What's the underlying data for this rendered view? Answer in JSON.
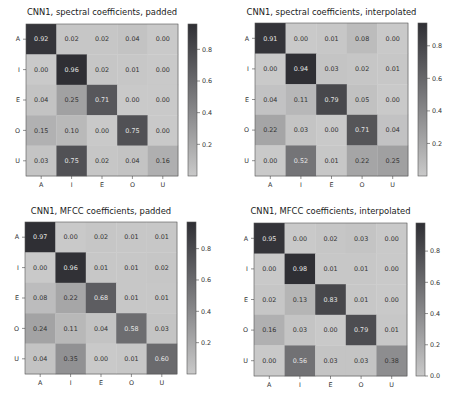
{
  "chart_data": [
    {
      "type": "heatmap",
      "title": "CNN1, spectral coefficients, padded",
      "row_labels": [
        "A",
        "I",
        "E",
        "O",
        "U"
      ],
      "col_labels": [
        "A",
        "I",
        "E",
        "O",
        "U"
      ],
      "values": [
        [
          0.92,
          0.02,
          0.02,
          0.04,
          0.0
        ],
        [
          0.0,
          0.96,
          0.02,
          0.01,
          0.0
        ],
        [
          0.04,
          0.25,
          0.71,
          0.0,
          0.0
        ],
        [
          0.15,
          0.1,
          0.0,
          0.75,
          0.0
        ],
        [
          0.03,
          0.75,
          0.02,
          0.04,
          0.16
        ]
      ],
      "colorbar": {
        "ticks": [
          "0.2",
          "0.4",
          "0.6",
          "0.8"
        ],
        "tick_values": [
          0.2,
          0.4,
          0.6,
          0.8
        ],
        "range": [
          0.0,
          0.96
        ]
      }
    },
    {
      "type": "heatmap",
      "title": "CNN1, spectral coefficients, interpolated",
      "row_labels": [
        "A",
        "I",
        "E",
        "O",
        "U"
      ],
      "col_labels": [
        "A",
        "I",
        "E",
        "O",
        "U"
      ],
      "values": [
        [
          0.91,
          0.0,
          0.01,
          0.08,
          0.0
        ],
        [
          0.0,
          0.94,
          0.03,
          0.02,
          0.01
        ],
        [
          0.04,
          0.11,
          0.79,
          0.05,
          0.0
        ],
        [
          0.22,
          0.03,
          0.0,
          0.71,
          0.04
        ],
        [
          0.0,
          0.52,
          0.01,
          0.22,
          0.25
        ]
      ],
      "colorbar": {
        "ticks": [
          "0.2",
          "0.4",
          "0.6",
          "0.8"
        ],
        "tick_values": [
          0.2,
          0.4,
          0.6,
          0.8
        ],
        "range": [
          0.0,
          0.94
        ]
      }
    },
    {
      "type": "heatmap",
      "title": "CNN1, MFCC coefficients, padded",
      "row_labels": [
        "A",
        "I",
        "E",
        "O",
        "U"
      ],
      "col_labels": [
        "A",
        "I",
        "E",
        "O",
        "U"
      ],
      "values": [
        [
          0.97,
          0.0,
          0.02,
          0.01,
          0.01
        ],
        [
          0.0,
          0.96,
          0.01,
          0.01,
          0.02
        ],
        [
          0.08,
          0.22,
          0.68,
          0.01,
          0.01
        ],
        [
          0.24,
          0.11,
          0.04,
          0.58,
          0.03
        ],
        [
          0.04,
          0.35,
          0.0,
          0.01,
          0.6
        ]
      ],
      "colorbar": {
        "ticks": [
          "0.2",
          "0.4",
          "0.6",
          "0.8"
        ],
        "tick_values": [
          0.2,
          0.4,
          0.6,
          0.8
        ],
        "range": [
          0.0,
          0.97
        ]
      }
    },
    {
      "type": "heatmap",
      "title": "CNN1, MFCC coefficients, interpolated",
      "row_labels": [
        "A",
        "I",
        "E",
        "O",
        "U"
      ],
      "col_labels": [
        "A",
        "I",
        "E",
        "O",
        "U"
      ],
      "values": [
        [
          0.95,
          0.0,
          0.02,
          0.03,
          0.0
        ],
        [
          0.0,
          0.98,
          0.01,
          0.01,
          0.0
        ],
        [
          0.02,
          0.13,
          0.83,
          0.01,
          0.0
        ],
        [
          0.16,
          0.03,
          0.0,
          0.79,
          0.01
        ],
        [
          0.0,
          0.56,
          0.03,
          0.03,
          0.38
        ]
      ],
      "colorbar": {
        "ticks": [
          "0.0",
          "0.2",
          "0.4",
          "0.6",
          "0.8"
        ],
        "tick_values": [
          0.0,
          0.2,
          0.4,
          0.6,
          0.8
        ],
        "range": [
          0.0,
          0.98
        ]
      }
    }
  ],
  "colormap": {
    "low": "#c9c9c9",
    "high": "#2f2f34",
    "text_dark": "#333333",
    "text_light": "#e8e8e8"
  }
}
